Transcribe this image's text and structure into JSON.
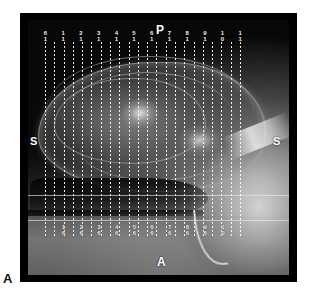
{
  "figure": {
    "panel_label": "A"
  },
  "scan": {
    "modality_type": "mri-sagittal-scout",
    "orientation_markers": {
      "posterior": "P",
      "anterior": "A",
      "superior_left": "S",
      "superior_right": "S"
    },
    "slice_overlay": {
      "line_style": "dotted",
      "line_color": "#ffffff",
      "line_count": 22,
      "reference_line_count": 2,
      "top_labels": [
        {
          "num": "6",
          "sub": "1"
        },
        {
          "num": "1",
          "sub": "1"
        },
        {
          "num": "2",
          "sub": "1"
        },
        {
          "num": "3",
          "sub": "1"
        },
        {
          "num": "4",
          "sub": "1"
        },
        {
          "num": "5",
          "sub": "1"
        },
        {
          "num": "6",
          "sub": "1"
        },
        {
          "num": "7",
          "sub": "1"
        },
        {
          "num": "8",
          "sub": "1"
        },
        {
          "num": "9",
          "sub": "1"
        },
        {
          "num": "1",
          "sub": "0"
        },
        {
          "num": "1",
          "sub": "1"
        }
      ],
      "bottom_labels": [
        {
          "num": "1",
          "sub": "6"
        },
        {
          "num": "2",
          "sub": "6"
        },
        {
          "num": "3",
          "sub": "6"
        },
        {
          "num": "4",
          "sub": "6"
        },
        {
          "num": "5",
          "sub": "6"
        },
        {
          "num": "6",
          "sub": "6"
        },
        {
          "num": "7",
          "sub": "6"
        },
        {
          "num": "8",
          "sub": "6"
        },
        {
          "num": "9",
          "sub": "6"
        },
        {
          "num": "1",
          "sub": "0"
        }
      ]
    },
    "colors": {
      "frame": "#000000",
      "overlay": "#ffffff",
      "background": "#ffffff"
    }
  }
}
